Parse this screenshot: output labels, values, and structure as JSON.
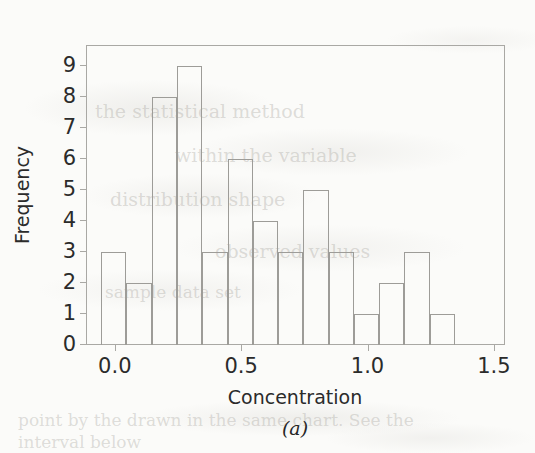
{
  "figure": {
    "caption": "(a)",
    "paper_background": "#fbfbf9",
    "ink_color": "#2b2b2b",
    "line_color": "#a9a8a4",
    "bar_edge_color": "#9d9c98",
    "bar_fill": "transparent"
  },
  "chart_data": {
    "type": "bar",
    "subtype": "histogram",
    "title": "",
    "xlabel": "Concentration",
    "ylabel": "Frequency",
    "xlim": [
      -0.11,
      1.54
    ],
    "ylim": [
      0,
      9.6
    ],
    "xticks": [
      0.0,
      0.5,
      1.0,
      1.5
    ],
    "xtick_labels": [
      "0.0",
      "0.5",
      "1.0",
      "1.5"
    ],
    "yticks": [
      0,
      1,
      2,
      3,
      4,
      5,
      6,
      7,
      8,
      9
    ],
    "ytick_labels": [
      "0",
      "1",
      "2",
      "3",
      "4",
      "5",
      "6",
      "7",
      "8",
      "9"
    ],
    "grid": false,
    "legend": false,
    "bin_width": 0.1,
    "bin_edges": [
      -0.05,
      0.05,
      0.15,
      0.25,
      0.35,
      0.45,
      0.55,
      0.65,
      0.75,
      0.85,
      0.95,
      1.05,
      1.15,
      1.25,
      1.35
    ],
    "bin_centers": [
      0.0,
      0.1,
      0.2,
      0.3,
      0.4,
      0.5,
      0.6,
      0.7,
      0.8,
      0.9,
      1.0,
      1.1,
      1.2,
      1.3
    ],
    "values": [
      3,
      2,
      8,
      9,
      3,
      6,
      4,
      3,
      5,
      3,
      1,
      2,
      3,
      1
    ],
    "total_count": 53,
    "bars": [
      {
        "index": 1,
        "bin_start": -0.05,
        "bin_end": 0.05,
        "center": 0.0,
        "frequency": 3
      },
      {
        "index": 2,
        "bin_start": 0.05,
        "bin_end": 0.15,
        "center": 0.1,
        "frequency": 2
      },
      {
        "index": 3,
        "bin_start": 0.15,
        "bin_end": 0.25,
        "center": 0.2,
        "frequency": 8
      },
      {
        "index": 4,
        "bin_start": 0.25,
        "bin_end": 0.35,
        "center": 0.3,
        "frequency": 9
      },
      {
        "index": 5,
        "bin_start": 0.35,
        "bin_end": 0.45,
        "center": 0.4,
        "frequency": 3
      },
      {
        "index": 6,
        "bin_start": 0.45,
        "bin_end": 0.55,
        "center": 0.5,
        "frequency": 6
      },
      {
        "index": 7,
        "bin_start": 0.55,
        "bin_end": 0.65,
        "center": 0.6,
        "frequency": 4
      },
      {
        "index": 8,
        "bin_start": 0.65,
        "bin_end": 0.75,
        "center": 0.7,
        "frequency": 3
      },
      {
        "index": 9,
        "bin_start": 0.75,
        "bin_end": 0.85,
        "center": 0.8,
        "frequency": 5
      },
      {
        "index": 10,
        "bin_start": 0.85,
        "bin_end": 0.95,
        "center": 0.9,
        "frequency": 3
      },
      {
        "index": 11,
        "bin_start": 0.95,
        "bin_end": 1.05,
        "center": 1.0,
        "frequency": 1
      },
      {
        "index": 12,
        "bin_start": 1.05,
        "bin_end": 1.15,
        "center": 1.1,
        "frequency": 2
      },
      {
        "index": 13,
        "bin_start": 1.15,
        "bin_end": 1.25,
        "center": 1.2,
        "frequency": 3
      },
      {
        "index": 14,
        "bin_start": 1.25,
        "bin_end": 1.35,
        "center": 1.3,
        "frequency": 1
      }
    ]
  }
}
